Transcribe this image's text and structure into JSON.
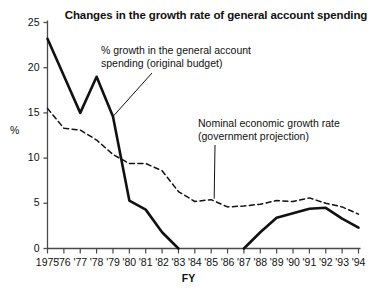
{
  "chart_data": {
    "type": "line",
    "title": "Changes in the growth rate of general account spending",
    "xlabel": "FY",
    "ylabel": "%",
    "xlim": [
      1975,
      1994
    ],
    "ylim": [
      0,
      25
    ],
    "yticks": [
      0,
      5,
      10,
      15,
      20,
      25
    ],
    "grid": false,
    "legend_position": "inline-annotations",
    "x": [
      1975,
      1976,
      1977,
      1978,
      1979,
      1980,
      1981,
      1982,
      1983,
      1984,
      1985,
      1986,
      1987,
      1988,
      1989,
      1990,
      1991,
      1992,
      1993,
      1994
    ],
    "xtick_labels": [
      "1975",
      "'76",
      "'77",
      "'78",
      "'79",
      "'80",
      "'81",
      "'82",
      "'83",
      "'84",
      "'85",
      "'86",
      "'87",
      "'88",
      "'89",
      "'90",
      "'91",
      "'92",
      "'93",
      "'94"
    ],
    "series": [
      {
        "name": "% growth in the general account spending (original budget)",
        "style": "solid",
        "color": "#111111",
        "values": [
          23.2,
          19.1,
          15.0,
          19.0,
          14.6,
          5.3,
          4.3,
          1.8,
          0.0,
          null,
          null,
          null,
          0.0,
          1.8,
          3.4,
          3.9,
          4.4,
          4.5,
          3.3,
          2.3
        ]
      },
      {
        "name": "Nominal economic growth rate (government projection)",
        "style": "dashed",
        "color": "#111111",
        "values": [
          15.5,
          13.3,
          13.1,
          12.0,
          10.4,
          9.4,
          9.4,
          8.6,
          6.3,
          5.2,
          5.4,
          4.6,
          4.7,
          4.9,
          5.3,
          5.2,
          5.6,
          5.0,
          4.6,
          3.8
        ]
      }
    ],
    "annotations": [
      {
        "id": "series1",
        "text_line1": "% growth in the general account",
        "text_line2": "spending (original budget)",
        "points_to_x": 1979,
        "points_to_y": 14.6
      },
      {
        "id": "series2",
        "text_line1": "Nominal economic growth rate",
        "text_line2": "(government projection)",
        "points_to_x": 1985,
        "points_to_y": 5.4
      }
    ]
  }
}
